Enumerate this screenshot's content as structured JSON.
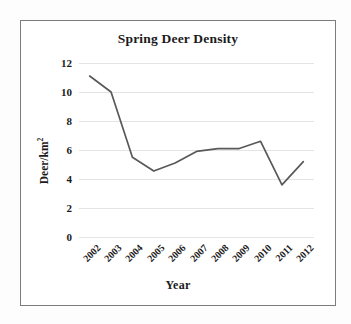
{
  "chart_data": {
    "type": "line",
    "title": "Spring Deer Density",
    "xlabel": "Year",
    "ylabel": "Deer/km²",
    "ylabel_base": "Deer/km",
    "ylabel_exponent": "2",
    "categories": [
      "2002",
      "2003",
      "2004",
      "2005",
      "2006",
      "2007",
      "2008",
      "2009",
      "2010",
      "2011",
      "2012"
    ],
    "values": [
      11.1,
      10.0,
      5.5,
      4.55,
      5.1,
      5.9,
      6.1,
      6.1,
      6.6,
      3.6,
      5.2
    ],
    "ylim": [
      0,
      12
    ],
    "yticks": [
      "12",
      "10",
      "8",
      "6",
      "4",
      "2",
      "0"
    ],
    "ytick_values": [
      12,
      10,
      8,
      6,
      4,
      2,
      0
    ],
    "grid": true,
    "legend": "none",
    "series": [
      {
        "name": "Spring Deer Density",
        "values": [
          11.1,
          10.0,
          5.5,
          4.55,
          5.1,
          5.9,
          6.1,
          6.1,
          6.6,
          3.6,
          5.2
        ]
      }
    ],
    "line_color": "#595959",
    "grid_color": "#e4e4e4",
    "frame_color": "#7c7c7c",
    "text_color": "#1b1b1b"
  }
}
